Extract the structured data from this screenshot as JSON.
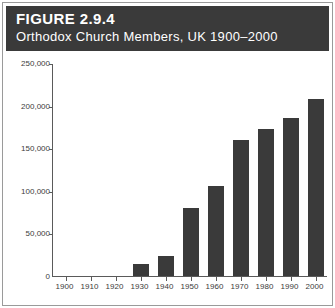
{
  "figure": {
    "number_label": "FIGURE 2.9.4",
    "subtitle": "Orthodox Church Members, UK 1900–2000"
  },
  "colors": {
    "header_band": "#3a3a3a",
    "bar_fill": "#3a3a3a",
    "axis_line": "#5a5a5a",
    "frame": "#9a9a9a",
    "text_dark": "#3c3c3c",
    "header_text": "#ffffff",
    "background": "#ffffff"
  },
  "chart_data": {
    "type": "bar",
    "title": "FIGURE 2.9.4",
    "subtitle": "Orthodox Church Members, UK 1900–2000",
    "xlabel": "",
    "ylabel": "",
    "categories": [
      "1900",
      "1910",
      "1920",
      "1930",
      "1940",
      "1950",
      "1960",
      "1970",
      "1980",
      "1990",
      "2000"
    ],
    "values": [
      0,
      0,
      0,
      14000,
      23000,
      80000,
      106000,
      160000,
      173000,
      185000,
      208000
    ],
    "ylim": [
      0,
      250000
    ],
    "ytick_values": [
      0,
      50000,
      100000,
      150000,
      200000,
      250000
    ],
    "ytick_labels": [
      "0",
      "50,000",
      "100,000",
      "150,000",
      "200,000",
      "250,000"
    ],
    "xtick_labels": [
      "1900",
      "1910",
      "1920",
      "1930",
      "1940",
      "1950",
      "1960",
      "1970",
      "1980",
      "1990",
      "2000"
    ],
    "grid": false,
    "legend": null
  }
}
